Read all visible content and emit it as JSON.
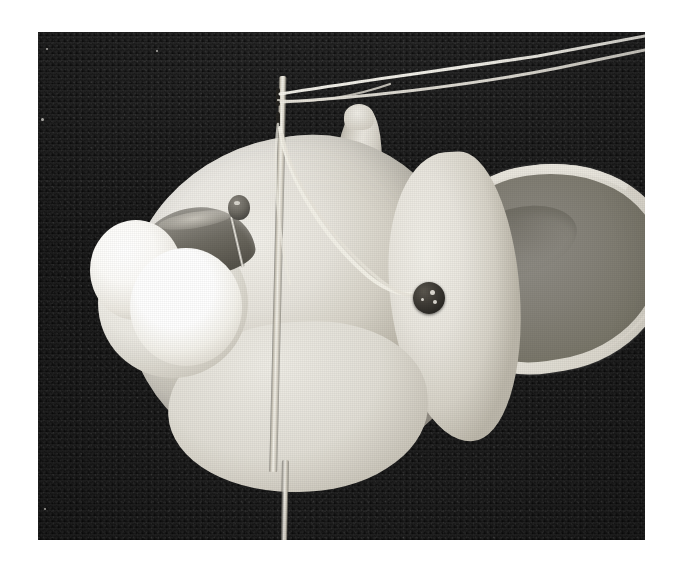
{
  "page": {
    "type": "photograph",
    "medium": "black-and-white halftone print",
    "canvas_bg": "#ffffff",
    "width": 682,
    "height": 566
  },
  "photo": {
    "frame": {
      "left": 38,
      "top": 32,
      "width": 607,
      "height": 508
    },
    "background": {
      "name": "dark felt backdrop",
      "color": "#1e1e1e",
      "texture": "fine woven / velvet grain"
    },
    "subject": {
      "name": "white plush toy mouse head",
      "description": "A cream-white felt mouse head lying on its side on a dark cloth, mid-assembly.",
      "body_color": "#e7e4dc",
      "shadow_color": "#aaa49a"
    },
    "parts": [
      {
        "name": "snout",
        "label": "Snout / nose",
        "color": "#ddd9cf"
      },
      {
        "name": "ear",
        "label": "Outer ear",
        "color": "#e2ded4"
      },
      {
        "name": "ear-inner",
        "label": "Inner ear",
        "color": "#858279"
      },
      {
        "name": "cheek",
        "label": "Cheek",
        "color": "#eceae3"
      },
      {
        "name": "jaw",
        "label": "Jaw / lower head",
        "color": "#e1ded5"
      }
    ],
    "tools": [
      {
        "name": "sewing-needle",
        "label": "Sewing needle",
        "color": "#f3f1e9",
        "detail": "long needle pushed vertically through the head, double eye visible at top"
      },
      {
        "name": "thread",
        "label": "White thread",
        "color": "#f4f2ea",
        "detail": "two strands run from the needle eye off to the upper right, a loop descends to the bead"
      },
      {
        "name": "straight-pin",
        "label": "Straight pin with bead head",
        "head_color": "#4b4944",
        "shaft_color": "#f0ede5"
      }
    ],
    "trim": [
      {
        "name": "bead-eye",
        "label": "Dark bead eye",
        "color": "#2c2a26"
      },
      {
        "name": "pom-pom-front",
        "label": "White pom-pom (front)",
        "color": "#ffffff"
      },
      {
        "name": "pom-pom-back",
        "label": "White pom-pom (back)",
        "color": "#fdfcf9"
      },
      {
        "name": "grey-felt-strip",
        "label": "Grey felt crescent",
        "color": "#6f6c63"
      }
    ]
  },
  "palette": {
    "backdrop": "#1e1e1e",
    "plush_light": "#f2f0ea",
    "plush_mid": "#d6d2c7",
    "plush_shadow": "#a6a096",
    "inner_ear": "#858279",
    "bead_dark": "#2c2a26",
    "thread_white": "#f4f2ea",
    "paper_white": "#ffffff"
  }
}
